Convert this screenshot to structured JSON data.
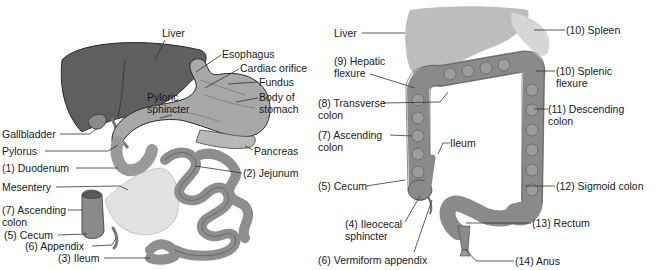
{
  "left_panel": {
    "title": "Small intestine and associated organs",
    "labels": [
      {
        "id": "liver",
        "lines": [
          "Liver"
        ],
        "x": 162,
        "y": 27
      },
      {
        "id": "esophagus",
        "lines": [
          "Esophagus"
        ],
        "x": 222,
        "y": 48
      },
      {
        "id": "cardiac-orifice",
        "lines": [
          "Cardiac orifice"
        ],
        "x": 240,
        "y": 62
      },
      {
        "id": "fundus",
        "lines": [
          "Fundus"
        ],
        "x": 259,
        "y": 76
      },
      {
        "id": "pyloric-sphincter",
        "lines": [
          "Pyloric",
          "sphincter"
        ],
        "x": 147,
        "y": 91
      },
      {
        "id": "body-of-stomach",
        "lines": [
          "Body of",
          "stomach"
        ],
        "x": 259,
        "y": 91
      },
      {
        "id": "gallbladder",
        "lines": [
          "Gallbladder"
        ],
        "x": 2,
        "y": 128
      },
      {
        "id": "pylorus",
        "lines": [
          "Pylorus"
        ],
        "x": 2,
        "y": 145
      },
      {
        "id": "pancreas",
        "lines": [
          "Pancreas"
        ],
        "x": 254,
        "y": 145
      },
      {
        "id": "duodenum",
        "lines": [
          "(1) Duodenum"
        ],
        "x": 2,
        "y": 162
      },
      {
        "id": "jejunum",
        "lines": [
          "(2) Jejunum"
        ],
        "x": 243,
        "y": 167
      },
      {
        "id": "mesentery",
        "lines": [
          "Mesentery"
        ],
        "x": 2,
        "y": 181
      },
      {
        "id": "ascending-colon",
        "lines": [
          "(7) Ascending",
          "colon"
        ],
        "x": 2,
        "y": 204
      },
      {
        "id": "cecum",
        "lines": [
          "(5) Cecum"
        ],
        "x": 4,
        "y": 229
      },
      {
        "id": "appendix",
        "lines": [
          "(6) Appendix"
        ],
        "x": 25,
        "y": 240
      },
      {
        "id": "ileum",
        "lines": [
          "(3) Ileum"
        ],
        "x": 58,
        "y": 252
      }
    ]
  },
  "right_panel": {
    "title": "Large intestine",
    "labels": [
      {
        "id": "liver",
        "lines": [
          "Liver"
        ],
        "x": 334,
        "y": 27
      },
      {
        "id": "spleen",
        "lines": [
          "(10) Spleen"
        ],
        "x": 566,
        "y": 24
      },
      {
        "id": "hepatic-flexure",
        "lines": [
          "(9) Hepatic",
          "flexure"
        ],
        "x": 334,
        "y": 55
      },
      {
        "id": "splenic-flexure",
        "lines": [
          "(10) Splenic",
          "flexure"
        ],
        "x": 556,
        "y": 65
      },
      {
        "id": "transverse-colon",
        "lines": [
          "(8) Transverse",
          "colon"
        ],
        "x": 318,
        "y": 97
      },
      {
        "id": "descending-colon",
        "lines": [
          "(11) Descending",
          "colon"
        ],
        "x": 548,
        "y": 103
      },
      {
        "id": "ascending-colon",
        "lines": [
          "(7) Ascending",
          "colon"
        ],
        "x": 318,
        "y": 129
      },
      {
        "id": "ileum",
        "lines": [
          "Ileum"
        ],
        "x": 450,
        "y": 137
      },
      {
        "id": "cecum",
        "lines": [
          "(5) Cecum"
        ],
        "x": 318,
        "y": 180
      },
      {
        "id": "sigmoid-colon",
        "lines": [
          "(12) Sigmoid colon"
        ],
        "x": 556,
        "y": 180
      },
      {
        "id": "ileocecal-sphincter",
        "lines": [
          "(4) Ileocecal",
          "sphincter"
        ],
        "x": 345,
        "y": 218
      },
      {
        "id": "rectum",
        "lines": [
          "(13) Rectum"
        ],
        "x": 532,
        "y": 217
      },
      {
        "id": "vermiform-appendix",
        "lines": [
          "(6) Vermiform appendix"
        ],
        "x": 318,
        "y": 254
      },
      {
        "id": "anus",
        "lines": [
          "(14) Anus"
        ],
        "x": 515,
        "y": 255
      }
    ]
  },
  "colors": {
    "liver_dark": "#5f5f5f",
    "liver_light": "#bdbdbd",
    "spleen": "#d6d6d6",
    "stomach": "#a8a8a8",
    "intestine": "#9a9a9a",
    "colon": "#8a8a8a",
    "mesentery": "#e2e2e2",
    "outline": "#333333",
    "leader": "#333333"
  }
}
